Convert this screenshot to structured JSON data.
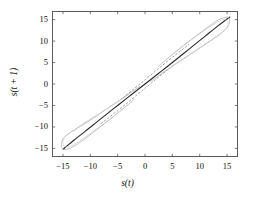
{
  "figure": {
    "background": "#ffffff",
    "frame_color": "#5a5a5a",
    "xlabel": "s(t)",
    "ylabel": "s(t + 1)"
  },
  "chart_data": {
    "type": "line",
    "title": "",
    "xlabel": "s(t)",
    "ylabel": "s(t + 1)",
    "xlim": [
      -17.0,
      17.0
    ],
    "ylim": [
      -17.0,
      17.0
    ],
    "xticks": [
      -15,
      -10,
      -5,
      0,
      5,
      10,
      15
    ],
    "yticks": [
      -15,
      -10,
      -5,
      0,
      5,
      10,
      15
    ],
    "xticklabels": [
      "−15",
      "−10",
      "−5",
      "0",
      "5",
      "10",
      "15"
    ],
    "yticklabels": [
      "−15",
      "−10",
      "−5",
      "0",
      "5",
      "10",
      "15"
    ],
    "grid": false,
    "legend": null,
    "tick_direction": "in",
    "ticks_all_sides": true,
    "series": [
      {
        "name": "main-diagonal-trace",
        "color": "#2a2a2a",
        "width": 1.1,
        "comment": "dense dark near-identity return map trace",
        "x": [
          -15.0,
          -13.0,
          -11.0,
          -9.0,
          -7.0,
          -5.0,
          -3.0,
          -1.0,
          1.0,
          3.0,
          5.0,
          7.0,
          9.0,
          11.0,
          13.0,
          15.5
        ],
        "y": [
          -15.2,
          -13.1,
          -11.1,
          -9.05,
          -7.0,
          -5.0,
          -3.0,
          -1.0,
          1.0,
          3.0,
          5.0,
          7.05,
          9.1,
          11.15,
          13.2,
          15.6
        ]
      },
      {
        "name": "hysteresis-loop-upper-outer",
        "color": "#b9b9b9",
        "width": 0.9,
        "x": [
          1.0,
          4.0,
          7.0,
          9.5,
          11.5,
          13.0,
          14.2,
          15.0,
          15.5,
          15.2,
          14.3,
          13.0,
          11.0,
          8.5,
          5.5,
          2.5
        ],
        "y": [
          0.6,
          3.2,
          5.8,
          8.0,
          9.7,
          11.0,
          12.1,
          13.2,
          14.6,
          15.5,
          15.4,
          14.6,
          12.8,
          10.4,
          7.4,
          4.2
        ]
      },
      {
        "name": "hysteresis-loop-upper-inner",
        "color": "#cdcdcd",
        "width": 0.8,
        "x": [
          3.0,
          6.0,
          9.0,
          11.5,
          13.2,
          14.4,
          15.2,
          15.0,
          14.0,
          12.2,
          9.8,
          6.8,
          3.8
        ],
        "y": [
          2.5,
          5.1,
          7.5,
          9.6,
          11.1,
          12.3,
          13.6,
          14.8,
          14.9,
          13.6,
          11.5,
          8.7,
          5.6
        ]
      },
      {
        "name": "hysteresis-loop-lower-outer",
        "color": "#b9b9b9",
        "width": 0.9,
        "x": [
          -1.0,
          -4.0,
          -7.0,
          -9.5,
          -11.5,
          -13.0,
          -14.2,
          -15.0,
          -15.3,
          -15.0,
          -14.0,
          -12.6,
          -10.5,
          -8.0,
          -5.0,
          -2.0
        ],
        "y": [
          -0.6,
          -3.2,
          -5.8,
          -8.0,
          -9.6,
          -10.8,
          -11.8,
          -12.8,
          -14.2,
          -15.2,
          -15.1,
          -14.2,
          -12.3,
          -9.8,
          -6.8,
          -3.6
        ]
      },
      {
        "name": "hysteresis-loop-lower-inner",
        "color": "#cdcdcd",
        "width": 0.8,
        "x": [
          -3.0,
          -6.0,
          -9.0,
          -11.5,
          -13.2,
          -14.4,
          -15.0,
          -14.8,
          -13.8,
          -12.0,
          -9.5,
          -6.5,
          -3.5
        ],
        "y": [
          -2.5,
          -5.0,
          -7.4,
          -9.4,
          -10.9,
          -12.0,
          -13.2,
          -14.4,
          -14.6,
          -13.3,
          -11.1,
          -8.3,
          -5.2
        ]
      },
      {
        "name": "sparse-center-strand-upper",
        "color": "#8a8a8a",
        "width": 0.8,
        "dash": "1.6 2.4",
        "x": [
          -4.0,
          -2.0,
          0.0,
          2.0,
          4.0,
          6.0,
          8.0
        ],
        "y": [
          -3.2,
          -1.1,
          1.0,
          3.1,
          5.2,
          7.2,
          9.2
        ]
      },
      {
        "name": "sparse-center-strand-lower",
        "color": "#8a8a8a",
        "width": 0.8,
        "dash": "1.6 2.4",
        "x": [
          -8.0,
          -6.0,
          -4.0,
          -2.0,
          0.0,
          2.0,
          4.0
        ],
        "y": [
          -9.2,
          -7.2,
          -5.2,
          -3.1,
          -1.0,
          1.1,
          3.2
        ]
      }
    ]
  }
}
